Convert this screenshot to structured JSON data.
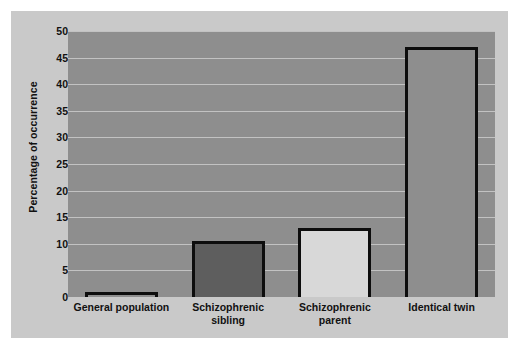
{
  "chart_data": {
    "type": "bar",
    "title": "",
    "xlabel": "",
    "ylabel": "Percentage of occurrence",
    "categories": [
      "General population",
      "Schizophrenic sibling",
      "Schizophrenic parent",
      "Identical twin"
    ],
    "category_lines": [
      [
        "General population"
      ],
      [
        "Schizophrenic",
        "sibling"
      ],
      [
        "Schizophrenic",
        "parent"
      ],
      [
        "Identical twin"
      ]
    ],
    "values": [
      1,
      10.5,
      13,
      47
    ],
    "ylim": [
      0,
      50
    ],
    "yticks": [
      0,
      5,
      10,
      15,
      20,
      25,
      30,
      35,
      40,
      45,
      50
    ],
    "ytick_labels": [
      "0",
      "5",
      "10",
      "15",
      "20",
      "25",
      "30",
      "35",
      "40",
      "45",
      "50"
    ],
    "grid": true,
    "legend": false,
    "bar_fills": [
      "#8e8e8e",
      "#5e5e5e",
      "#d8d8d8",
      "#8e8e8e"
    ],
    "bar_outline": "#0d0d0d",
    "plot_background": "#8e8e8e",
    "figure_background": "#c9c9c9",
    "gridline_color": "#c2c2c2"
  }
}
